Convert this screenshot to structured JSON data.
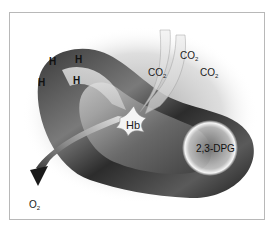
{
  "diagram": {
    "labels": {
      "hydrogen": [
        "H",
        "H",
        "H",
        "H"
      ],
      "co2": [
        {
          "base": "CO",
          "sub": "2"
        },
        {
          "base": "CO",
          "sub": "2"
        },
        {
          "base": "CO",
          "sub": "2"
        }
      ],
      "hemoglobin": "Hb",
      "dpg": "2,3-DPG",
      "o2": {
        "base": "O",
        "sub": "2"
      }
    },
    "colors": {
      "cell_dark": "#2a2a2a",
      "cell_mid": "#6e6e6e",
      "cell_light": "#d8d8d8",
      "frame_border": "#b8b8b8",
      "background": "#ffffff"
    }
  }
}
